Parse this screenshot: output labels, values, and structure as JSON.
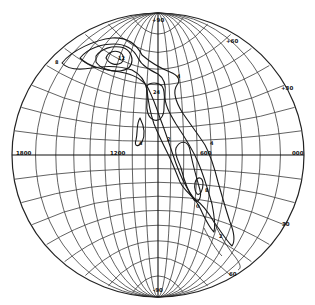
{
  "diagram": {
    "type": "stereographic-net-contour-plot",
    "projection": {
      "center_x": 158,
      "center_y": 155,
      "radius_x": 146,
      "radius_y": 142
    },
    "colors": {
      "background": "#ffffff",
      "grid": "#3a3a3a",
      "contour": "#1a1a1a"
    },
    "tick_labels": {
      "top": "+90",
      "upper_right_1": "+60",
      "upper_right_2": "+30",
      "lower_right_1": "30",
      "lower_right_2": "60",
      "bottom": "-90",
      "left_equator": "1800",
      "center_equator": "1200",
      "right_inner_equator": "600",
      "right_equator": "000"
    },
    "contour_labels": [
      {
        "text": "12",
        "x": 118,
        "y": 60
      },
      {
        "text": "8",
        "x": 55,
        "y": 64
      },
      {
        "text": "4",
        "x": 177,
        "y": 78
      },
      {
        "text": "24",
        "x": 153,
        "y": 94
      },
      {
        "text": "4",
        "x": 139,
        "y": 145
      },
      {
        "text": "2",
        "x": 167,
        "y": 141
      },
      {
        "text": "4",
        "x": 210,
        "y": 145
      },
      {
        "text": "0",
        "x": 196,
        "y": 208
      },
      {
        "text": "8",
        "x": 205,
        "y": 192
      },
      {
        "text": "2",
        "x": 219,
        "y": 238
      }
    ]
  }
}
